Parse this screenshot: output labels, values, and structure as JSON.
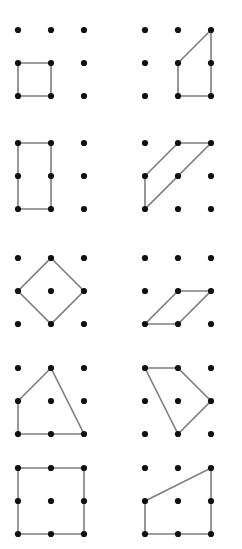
{
  "worksheet": {
    "title": "Geoboard shapes worksheet",
    "description": "Ten 3-by-3 dot grids arranged in five rows of two panels; each grid has a polygon drawn by connecting pegs.",
    "background_color": "#ffffff",
    "dot_color": "#111111",
    "line_color": "#7d7d7d",
    "dot_radius": 3.1,
    "line_width": 1.6,
    "grid": {
      "columns": 3,
      "rows": 3,
      "column_spacing": 33,
      "row_spacing": 33,
      "dot_label_columns": [
        "c1",
        "c2",
        "c3"
      ],
      "dot_label_rows": [
        "r1",
        "r2",
        "r3"
      ]
    },
    "panels": [
      {
        "id": "panel-1",
        "row": 1,
        "column": "left",
        "origin": [
          18,
          30
        ],
        "shape_name": "unit-square-bottom-left",
        "shape_type": "square",
        "vertices": [
          [
            0,
            1
          ],
          [
            1,
            1
          ],
          [
            1,
            2
          ],
          [
            0,
            2
          ]
        ]
      },
      {
        "id": "panel-2",
        "row": 1,
        "column": "right",
        "origin": [
          145,
          30
        ],
        "shape_name": "right-trapezoid",
        "shape_type": "trapezoid",
        "vertices": [
          [
            2,
            0
          ],
          [
            1,
            1
          ],
          [
            1,
            2
          ],
          [
            2,
            2
          ]
        ]
      },
      {
        "id": "panel-3",
        "row": 2,
        "column": "left",
        "origin": [
          18,
          143
        ],
        "shape_name": "tall-rectangle-left",
        "shape_type": "rectangle",
        "vertices": [
          [
            0,
            0
          ],
          [
            1,
            0
          ],
          [
            1,
            2
          ],
          [
            0,
            2
          ]
        ]
      },
      {
        "id": "panel-4",
        "row": 2,
        "column": "right",
        "origin": [
          145,
          143
        ],
        "shape_name": "slanted-parallelogram-up",
        "shape_type": "parallelogram",
        "vertices": [
          [
            0,
            1
          ],
          [
            1,
            0
          ],
          [
            2,
            0
          ],
          [
            0,
            2
          ]
        ]
      },
      {
        "id": "panel-5",
        "row": 3,
        "column": "left",
        "origin": [
          18,
          258
        ],
        "shape_name": "diamond-rhombus",
        "shape_type": "rhombus",
        "vertices": [
          [
            1,
            0
          ],
          [
            2,
            1
          ],
          [
            1,
            2
          ],
          [
            0,
            1
          ]
        ]
      },
      {
        "id": "panel-6",
        "row": 3,
        "column": "right",
        "origin": [
          145,
          258
        ],
        "shape_name": "low-parallelogram",
        "shape_type": "parallelogram",
        "vertices": [
          [
            1,
            1
          ],
          [
            2,
            1
          ],
          [
            1,
            2
          ],
          [
            0,
            2
          ]
        ]
      },
      {
        "id": "panel-7",
        "row": 4,
        "column": "left",
        "origin": [
          18,
          368
        ],
        "shape_name": "irregular-quadrilateral-peak",
        "shape_type": "quadrilateral",
        "vertices": [
          [
            1,
            0
          ],
          [
            2,
            2
          ],
          [
            0,
            2
          ],
          [
            0,
            1
          ]
        ]
      },
      {
        "id": "panel-8",
        "row": 4,
        "column": "right",
        "origin": [
          145,
          368
        ],
        "shape_name": "irregular-quadrilateral-kite",
        "shape_type": "quadrilateral",
        "vertices": [
          [
            0,
            0
          ],
          [
            1,
            0
          ],
          [
            2,
            1
          ],
          [
            1,
            2
          ]
        ]
      },
      {
        "id": "panel-9",
        "row": 5,
        "column": "left",
        "origin": [
          18,
          468
        ],
        "shape_name": "large-square-full-grid",
        "shape_type": "square",
        "vertices": [
          [
            0,
            0
          ],
          [
            2,
            0
          ],
          [
            2,
            2
          ],
          [
            0,
            2
          ]
        ]
      },
      {
        "id": "panel-10",
        "row": 5,
        "column": "right",
        "origin": [
          145,
          468
        ],
        "shape_name": "right-trapezoid-wide",
        "shape_type": "trapezoid",
        "vertices": [
          [
            0,
            1
          ],
          [
            2,
            0
          ],
          [
            2,
            2
          ],
          [
            0,
            2
          ]
        ]
      }
    ]
  }
}
